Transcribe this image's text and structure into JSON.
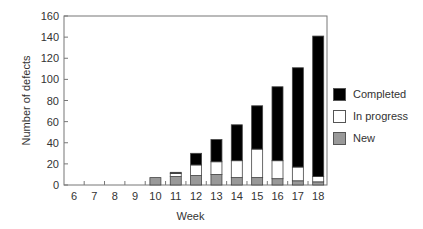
{
  "chart_data": {
    "type": "bar",
    "stacked": true,
    "title": "",
    "xlabel": "Week",
    "ylabel": "Number of defects",
    "ylim": [
      0,
      160
    ],
    "yticks": [
      0,
      20,
      40,
      60,
      80,
      100,
      120,
      140,
      160
    ],
    "categories": [
      "6",
      "7",
      "8",
      "9",
      "10",
      "11",
      "12",
      "13",
      "14",
      "15",
      "16",
      "17",
      "18"
    ],
    "series": [
      {
        "name": "New",
        "color": "#999999",
        "values": [
          0,
          0,
          0,
          0,
          7,
          8,
          9,
          10,
          7,
          7,
          6,
          4,
          3
        ]
      },
      {
        "name": "In progress",
        "color": "#ffffff",
        "values": [
          0,
          0,
          0,
          0,
          0,
          3,
          10,
          12,
          16,
          27,
          17,
          13,
          5
        ]
      },
      {
        "name": "Completed",
        "color": "#000000",
        "values": [
          0,
          0,
          0,
          0,
          0,
          1,
          11,
          21,
          34,
          41,
          70,
          94,
          133
        ]
      }
    ],
    "totals": [
      0,
      0,
      0,
      0,
      7,
      12,
      30,
      43,
      57,
      75,
      93,
      111,
      141
    ],
    "grid": false,
    "legend_position": "right",
    "legend_order": [
      "Completed",
      "In progress",
      "New"
    ]
  },
  "legend": {
    "items": [
      {
        "label": "Completed",
        "color": "#000000"
      },
      {
        "label": "In progress",
        "color": "#ffffff"
      },
      {
        "label": "New",
        "color": "#999999"
      }
    ]
  }
}
